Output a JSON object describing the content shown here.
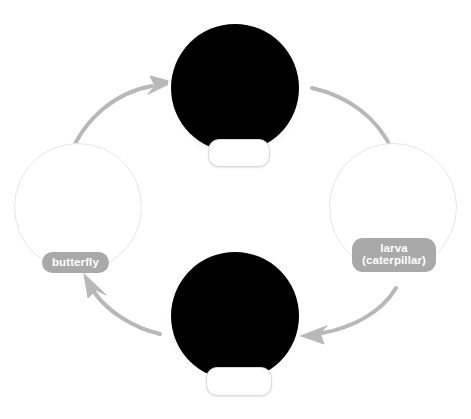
{
  "diagram": {
    "background_color": "#ffffff",
    "accent_pill_color": "#a9a9a9",
    "arrow_color": "#b3b3b3",
    "outline_color": "#e6e6e6",
    "photo_background_color": "#000000"
  },
  "nodes": [
    {
      "id": "egg",
      "position": "top",
      "kind": "photo",
      "image_subject": "butterfly egg with vertical ridges on a dark background",
      "label": "",
      "label_blank": true
    },
    {
      "id": "larva",
      "position": "right",
      "kind": "empty-circle",
      "image_subject": "",
      "label_lines": [
        "larva",
        "(caterpillar)"
      ],
      "label": "larva (caterpillar)",
      "label_blank": false
    },
    {
      "id": "pupa",
      "position": "bottom",
      "kind": "photo",
      "image_subject": "chrysalis / pupa hanging from a leaf on a dark background",
      "label": "",
      "label_blank": true
    },
    {
      "id": "butterfly",
      "position": "left",
      "kind": "empty-circle",
      "image_subject": "",
      "label_lines": [
        "butterfly"
      ],
      "label": "butterfly",
      "label_blank": false
    }
  ],
  "arrows": [
    {
      "id": "butterfly-to-egg",
      "from": "butterfly",
      "to": "egg",
      "direction": "up-right"
    },
    {
      "id": "egg-to-larva",
      "from": "egg",
      "to": "larva",
      "direction": "down-right"
    },
    {
      "id": "larva-to-pupa",
      "from": "larva",
      "to": "pupa",
      "direction": "down-left"
    },
    {
      "id": "pupa-to-butterfly",
      "from": "pupa",
      "to": "butterfly",
      "direction": "up-left"
    }
  ],
  "labels": {
    "butterfly": "butterfly",
    "larva_line1": "larva",
    "larva_line2": "(caterpillar)",
    "egg_blank": "",
    "pupa_blank": ""
  }
}
